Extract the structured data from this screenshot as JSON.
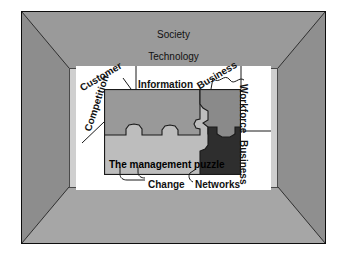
{
  "diagram": {
    "title": "The management puzzle",
    "frame": {
      "outer_color": "#0d0d0d",
      "bevel_top_color": "#9a9a9a",
      "bevel_left_color": "#8d8d8d",
      "bevel_right_color": "#8f8f8f",
      "bevel_bottom_color": "#a6a6a6",
      "mat_color": "#cfcfcf",
      "panel_color": "#ffffff"
    },
    "puzzle_colors": {
      "piece_top_left": "#999999",
      "piece_bottom": "#bdbdbd",
      "piece_top_right": "#8a8a8a",
      "piece_dark": "#2e2e2e",
      "outline": "#1a1a1a"
    },
    "labels": {
      "society": "Society",
      "technology": "Technology",
      "customer": "Customer",
      "information": "Information",
      "business_top": "Business",
      "workforce": "Workforce",
      "business_right": "Business",
      "competition": "Competition",
      "management_puzzle": "The management puzzle",
      "change": "Change",
      "networks": "Networks"
    }
  }
}
